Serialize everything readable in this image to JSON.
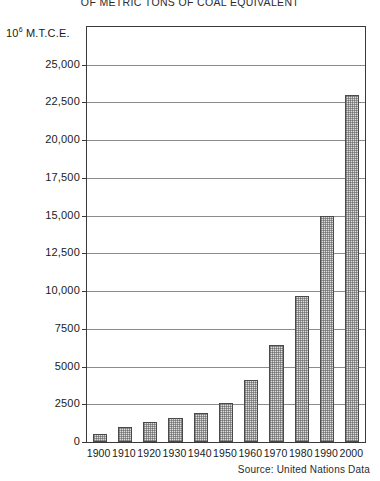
{
  "chart_data": {
    "type": "bar",
    "title": "OF METRIC TONS OF COAL EQUIVALENT",
    "subtitle": "",
    "xlabel": "",
    "ylabel": "10⁶ M.T.C.E.",
    "ylabel_base": "10",
    "ylabel_exp": "6",
    "ylabel_rest": "M.T.C.E.",
    "categories": [
      "1900",
      "1910",
      "1920",
      "1930",
      "1940",
      "1950",
      "1960",
      "1970",
      "1980",
      "1990",
      "2000"
    ],
    "values": [
      500,
      1000,
      1300,
      1600,
      1900,
      2600,
      4100,
      6400,
      9700,
      15000,
      23000
    ],
    "ylim": [
      0,
      27500
    ],
    "yticks": [
      0,
      2500,
      5000,
      7500,
      10000,
      12500,
      15000,
      17500,
      20000,
      22500,
      25000
    ],
    "ytick_labels": [
      "0",
      "2500",
      "5000",
      "7500",
      "10,000",
      "12,500",
      "15,000",
      "17,500",
      "20,000",
      "22,500",
      "25,000"
    ],
    "grid": true,
    "legend": "none",
    "bar_color": "#dedede",
    "bar_edge_color": "#4a4a4a",
    "grid_color": "#8b8b8b",
    "axis_color": "#3a3a3a"
  },
  "source": {
    "note": "Source: United Nations Data"
  }
}
